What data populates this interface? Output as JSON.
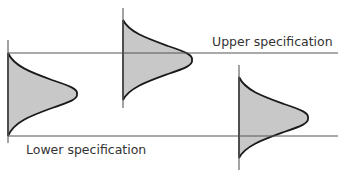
{
  "diagram": {
    "labels": {
      "upper_spec": "Upper specification",
      "lower_spec": "Lower specification"
    },
    "spec_lines": {
      "upper": {
        "y": 53,
        "x_start": 8,
        "x_end": 338
      },
      "lower": {
        "y": 136,
        "x_start": 8,
        "x_end": 338
      }
    },
    "distributions": [
      {
        "name": "distribution-centered",
        "axis_x": 8,
        "axis_top": 40,
        "axis_bottom": 143,
        "curve_top": 53,
        "curve_bottom": 136,
        "peak_x": 77,
        "peak_y": 94,
        "position": "within specification limits"
      },
      {
        "name": "distribution-shifted-up",
        "axis_x": 123,
        "axis_top": 8,
        "axis_bottom": 108,
        "curve_top": 20,
        "curve_bottom": 100,
        "peak_x": 192,
        "peak_y": 60,
        "position": "crossing upper specification"
      },
      {
        "name": "distribution-shifted-down",
        "axis_x": 239,
        "axis_top": 65,
        "axis_bottom": 170,
        "curve_top": 77,
        "curve_bottom": 158,
        "peak_x": 308,
        "peak_y": 118,
        "position": "crossing lower specification"
      }
    ],
    "colors": {
      "fill": "#c8c8c8",
      "curve_stroke": "#1a1a1a",
      "line_stroke": "#555555",
      "text": "#333333"
    }
  }
}
